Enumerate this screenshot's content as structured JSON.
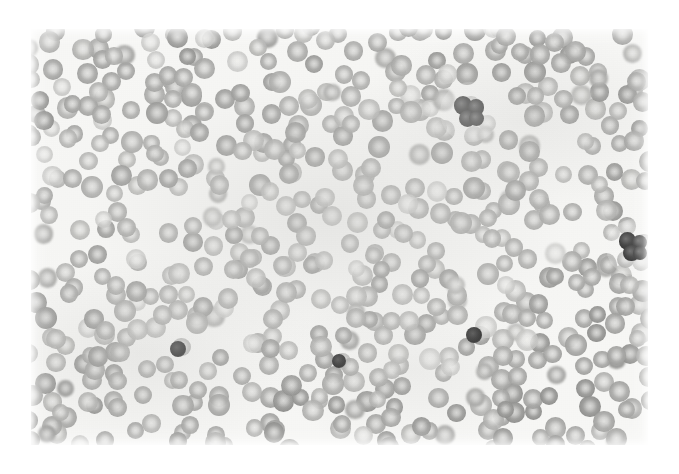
{
  "image": {
    "kind": "photomicrograph",
    "subject": "peripheral blood smear",
    "alt_text": "Light micrograph of a peripheral blood smear showing a dense monolayer of gray-stained red blood cells with central pallor, three small round dark-stained bodies, and a dark multilobed leukocyte nucleus at the upper middle and right edge.",
    "canvas_width": "679",
    "canvas_height": "474",
    "border_style": "white paper margin",
    "colors": {
      "paper": "#ffffff",
      "field_background": "#f7f7f5",
      "cell_rim": "#a5a5a3",
      "cell_pallor": "#d8d8d6",
      "dark_body": "#111111",
      "leukocyte_nucleus": "#3a3a3a"
    },
    "field": {
      "left": "31",
      "top": "29",
      "width": "617",
      "height": "416"
    },
    "counts": {
      "red_blood_cells": "approximately 560",
      "dark_round_bodies": "3",
      "leukocytes": "2"
    },
    "features": [
      {
        "name": "platelet-lower-left",
        "x": "178",
        "y": "349",
        "r": "8"
      },
      {
        "name": "platelet-lower-mid",
        "x": "339",
        "y": "361",
        "r": "7"
      },
      {
        "name": "platelet-lower-right",
        "x": "474",
        "y": "335",
        "r": "8"
      },
      {
        "name": "leukocyte-upper-mid",
        "x": "470",
        "y": "112",
        "r": "15"
      },
      {
        "name": "leukocyte-right-edge",
        "x": "634",
        "y": "247",
        "r": "14"
      }
    ]
  }
}
